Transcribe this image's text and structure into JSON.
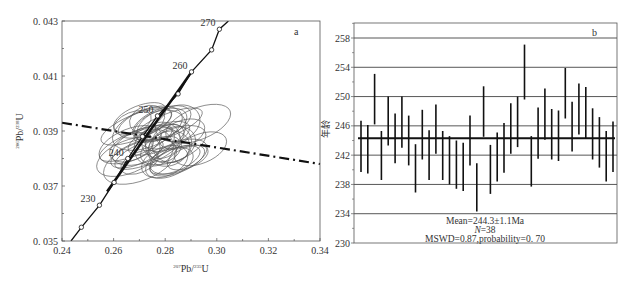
{
  "chart_data": [
    {
      "type": "scatter",
      "subtype": "concordia-ellipses",
      "panel_label": "a",
      "xlabel": "207Pb/235U",
      "ylabel": "206Pb/238U",
      "xlim": [
        0.24,
        0.34
      ],
      "ylim": [
        0.035,
        0.043
      ],
      "xticks": [
        "0.24",
        "0.26",
        "0.28",
        "0.30",
        "0.32",
        "0.34"
      ],
      "yticks": [
        "0. 035",
        "0. 037",
        "0. 039",
        "0. 041",
        "0. 043"
      ],
      "concordia_labels": [
        {
          "age": "230",
          "x": 0.2545,
          "y": 0.0363
        },
        {
          "age": "240",
          "x": 0.2655,
          "y": 0.038
        },
        {
          "age": "250",
          "x": 0.277,
          "y": 0.03955
        },
        {
          "age": "260",
          "x": 0.2902,
          "y": 0.04115
        },
        {
          "age": "270",
          "x": 0.301,
          "y": 0.0427
        }
      ],
      "concordia_markers": [
        {
          "x": 0.2475,
          "y": 0.0355
        },
        {
          "x": 0.2545,
          "y": 0.0363
        },
        {
          "x": 0.2602,
          "y": 0.03713
        },
        {
          "x": 0.2655,
          "y": 0.038
        },
        {
          "x": 0.2712,
          "y": 0.0388
        },
        {
          "x": 0.277,
          "y": 0.03955
        },
        {
          "x": 0.285,
          "y": 0.04035
        },
        {
          "x": 0.2902,
          "y": 0.04115
        },
        {
          "x": 0.298,
          "y": 0.04195
        },
        {
          "x": 0.301,
          "y": 0.0427
        }
      ],
      "discordia_line": {
        "x": [
          0.24,
          0.34
        ],
        "y": [
          0.0393,
          0.0378
        ],
        "style": "dash-dot"
      },
      "ellipses_count": 38,
      "ellipse_center_range": {
        "x": [
          0.265,
          0.295
        ],
        "y": [
          0.0378,
          0.0395
        ]
      }
    },
    {
      "type": "bar",
      "subtype": "weighted-mean-error-bars",
      "panel_label": "b",
      "ylabel": "年龄",
      "ylim": [
        230,
        258
      ],
      "yticks": [
        "230",
        "234",
        "238",
        "242",
        "246",
        "250",
        "254",
        "258"
      ],
      "gridlines": [
        234,
        238,
        242,
        246,
        250,
        254,
        258
      ],
      "mean_line": 244.3,
      "bars_low": [
        239.7,
        239.5,
        246.2,
        238.6,
        243.3,
        240.9,
        243.0,
        240.6,
        236.9,
        241.4,
        238.6,
        242.2,
        238.6,
        238.0,
        237.4,
        237.1,
        240.6,
        234.3,
        244.5,
        236.7,
        238.4,
        239.6,
        242.2,
        243.1,
        249.6,
        237.7,
        241.5,
        244.1,
        241.4,
        241.2,
        247.0,
        242.5,
        244.8,
        244.2,
        241.4,
        240.3,
        238.4,
        239.7
      ],
      "bars_high": [
        246.7,
        246.1,
        253.1,
        245.3,
        250.0,
        247.7,
        250.0,
        247.4,
        243.5,
        248.2,
        245.4,
        248.9,
        245.3,
        244.6,
        244.0,
        243.7,
        247.4,
        240.9,
        251.4,
        243.4,
        245.1,
        246.4,
        249.1,
        250.0,
        257.1,
        244.6,
        248.5,
        251.1,
        248.3,
        248.1,
        253.9,
        249.3,
        251.8,
        251.3,
        248.4,
        247.2,
        245.3,
        246.6
      ],
      "annotation": {
        "line1": "Mean=244.3±1.1Ma",
        "line2_prefix": "N",
        "line2_suffix": "=38",
        "line3": "MSWD=0.87,probability=0. 70"
      }
    }
  ],
  "labels": {
    "panel_a": "a",
    "panel_b": "b",
    "xlabel_a_sup1": "207",
    "xlabel_a_main1": "Pb/",
    "xlabel_a_sup2": "235",
    "xlabel_a_main2": "U",
    "ylabel_a_sup1": "206",
    "ylabel_a_main1": "Pb/",
    "ylabel_a_sup2": "238",
    "ylabel_a_main2": "U",
    "ylabel_b": "年龄"
  }
}
